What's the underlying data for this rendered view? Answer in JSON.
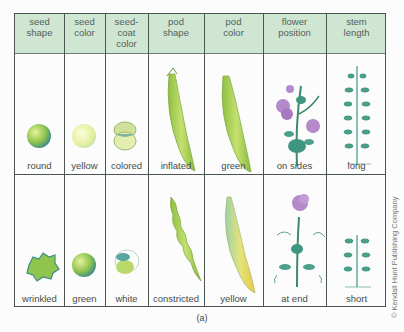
{
  "table": {
    "headers": [
      "seed shape",
      "seed color",
      "seed-coat color",
      "pod shape",
      "pod color",
      "flower position",
      "stem length"
    ],
    "header_lines": [
      [
        "seed",
        "shape"
      ],
      [
        "seed",
        "color"
      ],
      [
        "seed-",
        "coat",
        "color"
      ],
      [
        "pod",
        "shape"
      ],
      [
        "pod",
        "color"
      ],
      [
        "flower",
        "position"
      ],
      [
        "stem",
        "length"
      ]
    ],
    "rows": [
      {
        "labels": [
          "round",
          "yellow",
          "colored",
          "inflated",
          "green",
          "on sides",
          "long"
        ]
      },
      {
        "labels": [
          "wrinkled",
          "green",
          "white",
          "constricted",
          "yellow",
          "at end",
          "short"
        ]
      }
    ],
    "header_bg": "#cfe6d3"
  },
  "caption": "(a)",
  "copyright": "© Kendall Hunt Publishing Company"
}
